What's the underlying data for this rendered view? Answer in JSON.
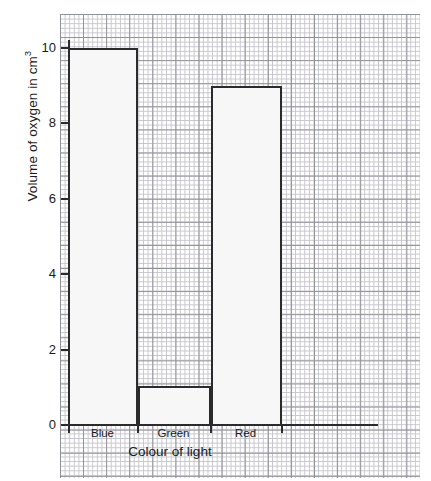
{
  "chart_data": {
    "type": "bar",
    "title": "",
    "categories": [
      "Blue",
      "Green",
      "Red"
    ],
    "values": [
      10,
      1,
      9
    ],
    "xlabel": "Colour of light",
    "ylabel": "Volume of oxygen in cm",
    "ylabel_superscript": "3",
    "ylim": [
      0,
      10
    ],
    "yticks": [
      0,
      2,
      4,
      6,
      8,
      10
    ],
    "ytick_labels": [
      "0",
      "2",
      "4",
      "6",
      "8",
      "10"
    ],
    "grid": true,
    "grid_style": "graph-paper",
    "legend": null,
    "bar_fill_color": "#f7f7f7",
    "bar_edge_color": "#2b2b2b",
    "grid_minor_color": "#c3c3ca",
    "grid_major_color": "#8b8b92",
    "axis_color": "#2b2b2b"
  },
  "labels": {
    "y_axis_title": "Volume of oxygen in cm",
    "y_axis_title_sup": "3",
    "x_axis_title": "Colour of light",
    "cat_0": "Blue",
    "cat_1": "Green",
    "cat_2": "Red",
    "ytick_0": "0",
    "ytick_1": "2",
    "ytick_2": "4",
    "ytick_3": "6",
    "ytick_4": "8",
    "ytick_5": "10"
  }
}
